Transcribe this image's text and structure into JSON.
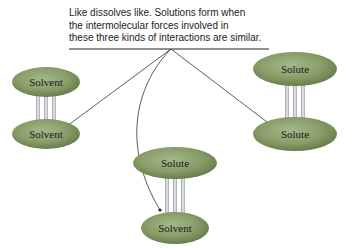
{
  "caption": {
    "lines": [
      "Like dissolves like. Solutions form when",
      "the intermolecular forces involved in",
      "these three kinds of interactions are similar."
    ]
  },
  "pairs": [
    {
      "name": "solvent-solvent",
      "top": "Solvent",
      "bottom": "Solvent"
    },
    {
      "name": "solute-solute",
      "top": "Solute",
      "bottom": "Solute"
    },
    {
      "name": "solute-solvent",
      "top": "Solute",
      "bottom": "Solvent"
    }
  ],
  "colors": {
    "molecule": "#8aa06a",
    "molecule_edge": "#5f7a45",
    "bond": "#c7c7d0",
    "line": "#333333"
  }
}
